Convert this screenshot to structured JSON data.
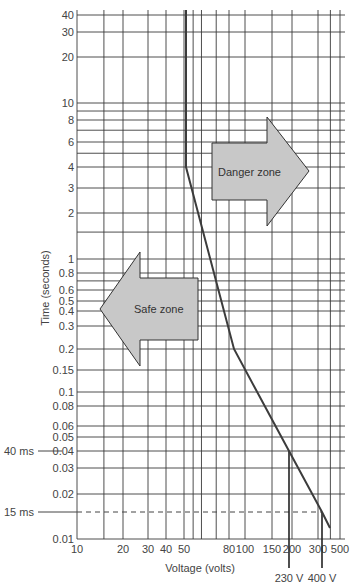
{
  "chart_data": {
    "type": "line",
    "title": "",
    "xlabel": "Voltage (volts)",
    "ylabel": "Time (seconds)",
    "xscale": "log",
    "yscale": "log",
    "xlim": [
      10,
      500
    ],
    "ylim": [
      0.01,
      40
    ],
    "x_ticks": [
      {
        "v": 10,
        "label": "10"
      },
      {
        "v": 20,
        "label": "20"
      },
      {
        "v": 30,
        "label": "30"
      },
      {
        "v": 40,
        "label": "40"
      },
      {
        "v": 50,
        "label": "50"
      },
      {
        "v": 80,
        "label": "80"
      },
      {
        "v": 100,
        "label": "100"
      },
      {
        "v": 150,
        "label": "150"
      },
      {
        "v": 200,
        "label": "200"
      },
      {
        "v": 300,
        "label": "300"
      },
      {
        "v": 500,
        "label": "500"
      }
    ],
    "x_grid": [
      10,
      15,
      20,
      30,
      40,
      50,
      55,
      60,
      70,
      80,
      100,
      150,
      200,
      300,
      400,
      500
    ],
    "y_ticks": [
      {
        "v": 40,
        "label": "40"
      },
      {
        "v": 30,
        "label": "30"
      },
      {
        "v": 20,
        "label": "20"
      },
      {
        "v": 10,
        "label": "10"
      },
      {
        "v": 8,
        "label": "8"
      },
      {
        "v": 6,
        "label": "6"
      },
      {
        "v": 4,
        "label": "4"
      },
      {
        "v": 3,
        "label": "3"
      },
      {
        "v": 2,
        "label": "2"
      },
      {
        "v": 1,
        "label": "1"
      },
      {
        "v": 0.8,
        "label": "0.8"
      },
      {
        "v": 0.6,
        "label": "0.6"
      },
      {
        "v": 0.5,
        "label": "0.5"
      },
      {
        "v": 0.4,
        "label": "0.4"
      },
      {
        "v": 0.3,
        "label": "0.3"
      },
      {
        "v": 0.2,
        "label": "0.2"
      },
      {
        "v": 0.15,
        "label": "0.15"
      },
      {
        "v": 0.1,
        "label": "0.1"
      },
      {
        "v": 0.08,
        "label": "0.08"
      },
      {
        "v": 0.06,
        "label": "0.06"
      },
      {
        "v": 0.05,
        "label": "0.05"
      },
      {
        "v": 0.04,
        "label": "0.04"
      },
      {
        "v": 0.03,
        "label": "0.03"
      },
      {
        "v": 0.02,
        "label": "0.02"
      },
      {
        "v": 0.01,
        "label": "0.01"
      }
    ],
    "y_grid": [
      40,
      30,
      20,
      10,
      9,
      8,
      7,
      6,
      5,
      4,
      3,
      2,
      1.5,
      1,
      0.8,
      0.7,
      0.6,
      0.5,
      0.4,
      0.3,
      0.2,
      0.15,
      0.1,
      0.08,
      0.06,
      0.05,
      0.04,
      0.03,
      0.02,
      0.01
    ],
    "grid": true,
    "series": [
      {
        "name": "Safety curve",
        "x": [
          50,
          50,
          120,
          230,
          400,
          460
        ],
        "y": [
          40,
          4,
          0.2,
          0.04,
          0.015,
          0.011
        ]
      }
    ],
    "annotations": [
      {
        "text": "Danger zone",
        "type": "arrow-right"
      },
      {
        "text": "Safe zone",
        "type": "arrow-left"
      },
      {
        "text": "40 ms",
        "y": 0.04,
        "side": "left"
      },
      {
        "text": "15 ms",
        "y": 0.015,
        "side": "left",
        "dashed": true
      },
      {
        "text": "230 V",
        "x": 230,
        "side": "bottom"
      },
      {
        "text": "400 V",
        "x": 400,
        "side": "bottom"
      }
    ],
    "legend": "none"
  },
  "labels": {
    "xlabel": "Voltage (volts)",
    "ylabel": "Time (seconds)",
    "danger": "Danger zone",
    "safe": "Safe zone",
    "ms40": "40 ms",
    "ms15": "15 ms",
    "v230": "230 V",
    "v400": "400 V"
  },
  "colors": {
    "grid": "#3a3a3a",
    "curve": "#3c3c3c",
    "arrow_fill": "#c8c8c8",
    "arrow_stroke": "#333333",
    "text": "#444444"
  }
}
